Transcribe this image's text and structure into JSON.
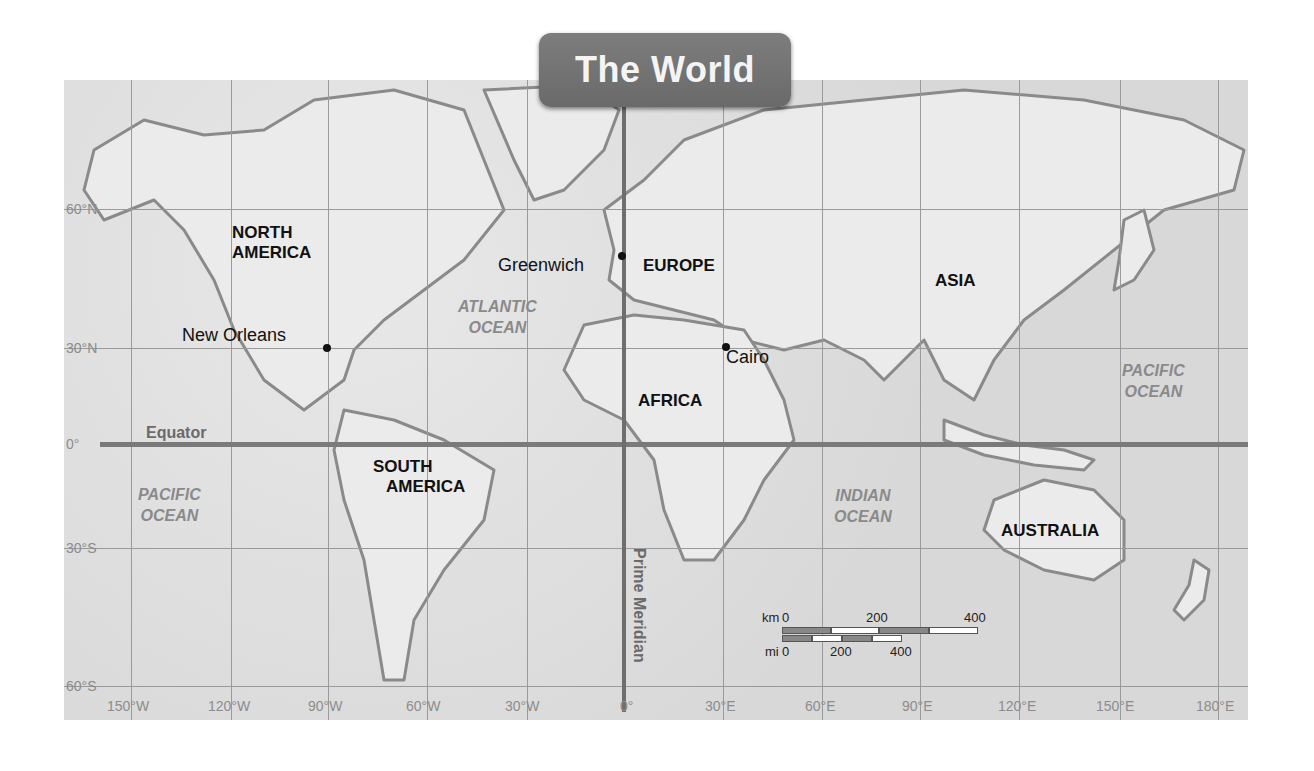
{
  "title": "The World",
  "continents": [
    {
      "name": "NORTH AMERICA",
      "lines": [
        "NORTH",
        "AMERICA"
      ]
    },
    {
      "name": "SOUTH AMERICA",
      "lines": [
        "SOUTH",
        "AMERICA"
      ]
    },
    {
      "name": "EUROPE",
      "lines": [
        "EUROPE"
      ]
    },
    {
      "name": "AFRICA",
      "lines": [
        "AFRICA"
      ]
    },
    {
      "name": "ASIA",
      "lines": [
        "ASIA"
      ]
    },
    {
      "name": "AUSTRALIA",
      "lines": [
        "AUSTRALIA"
      ]
    }
  ],
  "oceans": [
    {
      "name": "ATLANTIC OCEAN",
      "lines": [
        "ATLANTIC",
        "OCEAN"
      ]
    },
    {
      "name": "PACIFIC OCEAN (west)",
      "lines": [
        "PACIFIC",
        "OCEAN"
      ]
    },
    {
      "name": "PACIFIC OCEAN (east)",
      "lines": [
        "PACIFIC",
        "OCEAN"
      ]
    },
    {
      "name": "INDIAN OCEAN",
      "lines": [
        "INDIAN",
        "OCEAN"
      ]
    }
  ],
  "cities": [
    {
      "name": "New Orleans"
    },
    {
      "name": "Greenwich"
    },
    {
      "name": "Cairo"
    }
  ],
  "reference_lines": {
    "equator": "Equator",
    "prime_meridian": "Prime Meridian"
  },
  "latitude_labels": [
    "60°N",
    "30°N",
    "0°",
    "30°S",
    "60°S"
  ],
  "longitude_labels": [
    "150°W",
    "120°W",
    "90°W",
    "60°W",
    "30°W",
    "0°",
    "30°E",
    "60°E",
    "90°E",
    "120°E",
    "150°E",
    "180°E"
  ],
  "scale_bar": {
    "km_unit": "km",
    "km_ticks": [
      "0",
      "200",
      "400"
    ],
    "mi_unit": "mi",
    "mi_ticks": [
      "0",
      "200",
      "400"
    ]
  },
  "colors": {
    "title_tab": "#737373",
    "title_text": "#f4f4f4",
    "ocean_label": "#8a8a8a",
    "reference_line": "#6e6e6e",
    "land": "#ebebeb",
    "water": "#dcdcdc"
  }
}
